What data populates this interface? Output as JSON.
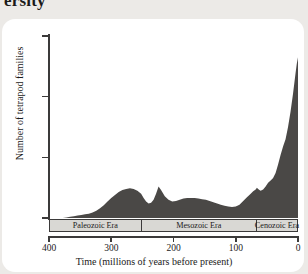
{
  "page": {
    "heading_partial": "ersity",
    "background_color": "#eceae7",
    "card_color": "#ffffff"
  },
  "chart_data": {
    "type": "area",
    "title": "",
    "xlabel": "Time (millions of years before present)",
    "ylabel": "Number of tetrapod families",
    "xlim": [
      400,
      0
    ],
    "ylim": [
      0,
      300
    ],
    "x_ticks": [
      400,
      300,
      200,
      100,
      0
    ],
    "y_ticks": [
      0,
      100,
      200,
      300
    ],
    "x_axis_reversed": true,
    "grid": false,
    "legend": "none",
    "series_color": "#4a4846",
    "series": [
      {
        "name": "Tetrapod families",
        "x": [
          400,
          392,
          385,
          378,
          372,
          366,
          360,
          354,
          348,
          342,
          336,
          330,
          324,
          318,
          312,
          306,
          300,
          294,
          288,
          282,
          276,
          270,
          264,
          258,
          252,
          248,
          244,
          240,
          236,
          232,
          228,
          224,
          220,
          214,
          208,
          202,
          196,
          190,
          184,
          178,
          172,
          166,
          160,
          154,
          148,
          142,
          136,
          130,
          124,
          118,
          112,
          106,
          100,
          94,
          88,
          82,
          76,
          72,
          68,
          66,
          64,
          62,
          60,
          56,
          52,
          48,
          44,
          40,
          36,
          32,
          28,
          24,
          20,
          16,
          12,
          8,
          4,
          2,
          0
        ],
        "values": [
          0,
          0,
          0,
          0,
          1,
          2,
          3,
          4,
          5,
          6,
          7,
          9,
          12,
          16,
          21,
          27,
          33,
          38,
          43,
          46,
          48,
          49,
          48,
          45,
          40,
          33,
          27,
          24,
          25,
          30,
          40,
          52,
          46,
          36,
          30,
          27,
          28,
          30,
          32,
          33,
          33,
          33,
          32,
          31,
          30,
          28,
          26,
          24,
          22,
          20,
          19,
          18,
          19,
          22,
          28,
          34,
          40,
          44,
          47,
          50,
          48,
          46,
          45,
          47,
          52,
          58,
          62,
          66,
          74,
          88,
          104,
          118,
          130,
          150,
          175,
          205,
          238,
          254,
          265
        ]
      }
    ],
    "eras": [
      {
        "label": "Paleozoic Era",
        "start": 400,
        "end": 252
      },
      {
        "label": "Mesozoic Era",
        "start": 252,
        "end": 66
      },
      {
        "label": "Cenozoic Era",
        "start": 66,
        "end": 0
      }
    ]
  }
}
